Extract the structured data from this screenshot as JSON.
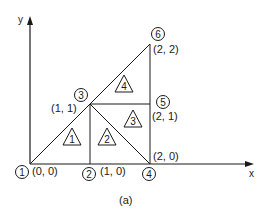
{
  "diagram": {
    "caption": "(a)",
    "axes": {
      "x_label": "x",
      "y_label": "y"
    },
    "nodes": [
      {
        "id": "1",
        "coord_label": "(0, 0)"
      },
      {
        "id": "2",
        "coord_label": "(1, 0)"
      },
      {
        "id": "3",
        "coord_label": "(1, 1)"
      },
      {
        "id": "4",
        "coord_label": "(2, 0)"
      },
      {
        "id": "5",
        "coord_label": "(2, 1)"
      },
      {
        "id": "6",
        "coord_label": "(2, 2)"
      }
    ],
    "elements": [
      {
        "id": "1",
        "nodes": [
          "1",
          "2",
          "3"
        ]
      },
      {
        "id": "2",
        "nodes": [
          "2",
          "4",
          "3"
        ]
      },
      {
        "id": "3",
        "nodes": [
          "3",
          "4",
          "5"
        ]
      },
      {
        "id": "4",
        "nodes": [
          "3",
          "5",
          "6"
        ]
      }
    ],
    "colors": {
      "stroke": "#1a1a1a",
      "background": "#ffffff"
    }
  }
}
